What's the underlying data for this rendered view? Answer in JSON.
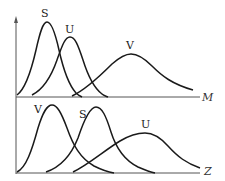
{
  "diagram": {
    "type": "stacked-distribution-curves",
    "panels": [
      {
        "name": "top",
        "axis_label": "M",
        "curves": [
          {
            "label": "S",
            "peak_x": 47,
            "peak_y": 22,
            "width": "narrow"
          },
          {
            "label": "U",
            "peak_x": 70,
            "peak_y": 37,
            "width": "narrow"
          },
          {
            "label": "V",
            "peak_x": 131,
            "peak_y": 54,
            "width": "wide"
          }
        ]
      },
      {
        "name": "bottom",
        "axis_label": "Z",
        "curves": [
          {
            "label": "V",
            "peak_x": 52,
            "peak_y": 105,
            "width": "narrow"
          },
          {
            "label": "S",
            "peak_x": 96,
            "peak_y": 107,
            "width": "narrow"
          },
          {
            "label": "U",
            "peak_x": 145,
            "peak_y": 133,
            "width": "wide"
          }
        ]
      }
    ],
    "colors": {
      "curve": "#1a1a1a",
      "axis": "#555555"
    }
  },
  "labels": {
    "top_axis": "M",
    "bottom_axis": "Z",
    "top_S": "S",
    "top_U": "U",
    "top_V": "V",
    "bottom_V": "V",
    "bottom_S": "S",
    "bottom_U": "U"
  }
}
